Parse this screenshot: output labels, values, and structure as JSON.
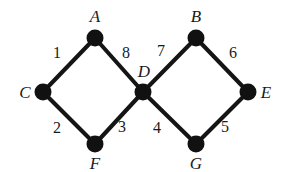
{
  "figure": {
    "background_color": "#ffffff",
    "stroke_color": "#151515",
    "vertex_color": "#111111",
    "text_color": "#1a1a1a",
    "width": 284,
    "height": 171
  },
  "vertices": [
    {
      "id": "A",
      "label": "A",
      "cx": 95,
      "cy": 38,
      "r": 8.5,
      "label_x": 95,
      "label_y": 16
    },
    {
      "id": "B",
      "label": "B",
      "cx": 196,
      "cy": 38,
      "r": 8.5,
      "label_x": 196,
      "label_y": 16
    },
    {
      "id": "C",
      "label": "C",
      "cx": 43,
      "cy": 92,
      "r": 8.5,
      "label_x": 25,
      "label_y": 92
    },
    {
      "id": "D",
      "label": "D",
      "cx": 143,
      "cy": 92,
      "r": 8.5,
      "label_x": 144,
      "label_y": 71
    },
    {
      "id": "E",
      "label": "E",
      "cx": 248,
      "cy": 92,
      "r": 8.5,
      "label_x": 266,
      "label_y": 92
    },
    {
      "id": "F",
      "label": "F",
      "cx": 95,
      "cy": 144,
      "r": 8.5,
      "label_x": 95,
      "label_y": 163
    },
    {
      "id": "G",
      "label": "G",
      "cx": 196,
      "cy": 144,
      "r": 8.5,
      "label_x": 196,
      "label_y": 163
    }
  ],
  "edges": [
    {
      "from": "C",
      "to": "A",
      "weight": "1",
      "x1": 43,
      "y1": 92,
      "x2": 95,
      "y2": 38,
      "label_x": 57,
      "label_y": 53
    },
    {
      "from": "C",
      "to": "F",
      "weight": "2",
      "x1": 43,
      "y1": 92,
      "x2": 95,
      "y2": 144,
      "label_x": 57,
      "label_y": 128
    },
    {
      "from": "F",
      "to": "D",
      "weight": "3",
      "x1": 95,
      "y1": 144,
      "x2": 143,
      "y2": 92,
      "label_x": 122,
      "label_y": 127
    },
    {
      "from": "D",
      "to": "G",
      "weight": "4",
      "x1": 143,
      "y1": 92,
      "x2": 196,
      "y2": 144,
      "label_x": 157,
      "label_y": 128
    },
    {
      "from": "G",
      "to": "E",
      "weight": "5",
      "x1": 196,
      "y1": 144,
      "x2": 248,
      "y2": 92,
      "label_x": 225,
      "label_y": 127
    },
    {
      "from": "B",
      "to": "E",
      "weight": "6",
      "x1": 196,
      "y1": 38,
      "x2": 248,
      "y2": 92,
      "label_x": 233,
      "label_y": 53
    },
    {
      "from": "D",
      "to": "B",
      "weight": "7",
      "x1": 143,
      "y1": 92,
      "x2": 196,
      "y2": 38,
      "label_x": 161,
      "label_y": 51
    },
    {
      "from": "A",
      "to": "D",
      "weight": "8",
      "x1": 95,
      "y1": 38,
      "x2": 143,
      "y2": 92,
      "label_x": 126,
      "label_y": 53
    }
  ]
}
